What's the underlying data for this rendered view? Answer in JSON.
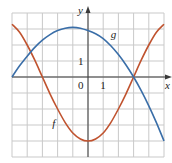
{
  "chart_data": {
    "type": "line",
    "title": "",
    "xlabel": "x",
    "ylabel": "y",
    "xlim": [
      -5,
      5
    ],
    "ylim": [
      -5,
      4
    ],
    "grid": true,
    "tick_labels": {
      "origin": "0",
      "x_unit": "1",
      "y_unit": "1"
    },
    "series": [
      {
        "name": "f",
        "color": "#c0532f",
        "points": [
          [
            -5,
            3.3
          ],
          [
            -4.5,
            2.8
          ],
          [
            -4,
            2.0
          ],
          [
            -3.5,
            1.05
          ],
          [
            -3,
            0
          ],
          [
            -2.5,
            -1.05
          ],
          [
            -2,
            -2.0
          ],
          [
            -1.5,
            -2.85
          ],
          [
            -1,
            -3.5
          ],
          [
            -0.5,
            -3.87
          ],
          [
            0,
            -4
          ],
          [
            0.5,
            -3.87
          ],
          [
            1,
            -3.5
          ],
          [
            1.5,
            -2.85
          ],
          [
            2,
            -2.0
          ],
          [
            2.5,
            -1.05
          ],
          [
            3,
            0
          ],
          [
            3.5,
            1.05
          ],
          [
            4,
            2.0
          ],
          [
            4.5,
            2.8
          ],
          [
            5,
            3.3
          ]
        ]
      },
      {
        "name": "g",
        "color": "#3a6ea8",
        "points": [
          [
            -5,
            0
          ],
          [
            -4.5,
            0.7
          ],
          [
            -4,
            1.3
          ],
          [
            -3.5,
            1.85
          ],
          [
            -3,
            2.3
          ],
          [
            -2.5,
            2.65
          ],
          [
            -2,
            2.9
          ],
          [
            -1.5,
            3.05
          ],
          [
            -1,
            3.1
          ],
          [
            -0.5,
            3.05
          ],
          [
            0,
            2.9
          ],
          [
            0.5,
            2.7
          ],
          [
            1,
            2.4
          ],
          [
            1.5,
            1.95
          ],
          [
            2,
            1.4
          ],
          [
            2.5,
            0.75
          ],
          [
            3,
            0
          ],
          [
            3.5,
            -0.85
          ],
          [
            4,
            -1.8
          ],
          [
            4.5,
            -2.85
          ],
          [
            5,
            -4
          ]
        ]
      }
    ],
    "annotations": [
      {
        "text": "f",
        "x": -2.35,
        "y": -3.1
      },
      {
        "text": "g",
        "x": 1.5,
        "y": 2.45
      }
    ]
  },
  "style": {
    "grid_color": "#c9c9c9",
    "axis_color": "#3a3a3a",
    "background": "#ffffff"
  },
  "labels": {
    "x_axis": "x",
    "y_axis": "y",
    "origin": "0",
    "x_one": "1",
    "y_one": "1",
    "f_label": "f",
    "g_label": "g"
  }
}
